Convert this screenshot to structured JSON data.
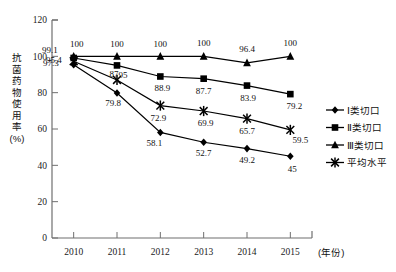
{
  "chart_data": {
    "type": "line",
    "title": "",
    "subtitle": "",
    "xlabel": "(年份)",
    "ylabel": "抗菌药物使用率（%）",
    "ylabel_chars": [
      "抗",
      "菌",
      "药",
      "物",
      "使",
      "用",
      "率",
      "(%)"
    ],
    "x": [
      "2010",
      "2011",
      "2012",
      "2013",
      "2014",
      "2015"
    ],
    "categories": [
      "2010",
      "2011",
      "2012",
      "2013",
      "2014",
      "2015"
    ],
    "ylim": [
      0,
      120
    ],
    "yticks": [
      0,
      20,
      40,
      60,
      80,
      100,
      120
    ],
    "ytick_labels": [
      "0",
      "20",
      "40",
      "60",
      "80",
      "100",
      "120"
    ],
    "grid": false,
    "legend_position": "right",
    "series": [
      {
        "name": "Ⅰ类切口",
        "marker": "diamond",
        "values": [
          95.4,
          79.8,
          58.1,
          52.7,
          49.2,
          45
        ],
        "labels": [
          "95.4",
          "79.8",
          "58.1",
          "52.7",
          "49.2",
          "45"
        ]
      },
      {
        "name": "Ⅱ类切口",
        "marker": "square",
        "values": [
          99.1,
          95,
          88.9,
          87.7,
          83.9,
          79.2
        ],
        "labels": [
          "99.1",
          "95",
          "88.9",
          "87.7",
          "83.9",
          "79.2"
        ]
      },
      {
        "name": "Ⅲ类切口",
        "marker": "triangle",
        "values": [
          100,
          100,
          100,
          100,
          96.4,
          100
        ],
        "labels": [
          "100",
          "100",
          "100",
          "100",
          "96.4",
          "100"
        ]
      },
      {
        "name": "平均水平",
        "marker": "cross",
        "values": [
          97.3,
          87,
          72.9,
          69.9,
          65.7,
          59.5
        ],
        "labels": [
          "97.3",
          "87",
          "72.9",
          "69.9",
          "65.7",
          "59.5"
        ]
      }
    ]
  },
  "legend": {
    "items": [
      {
        "label": "Ⅰ类切口",
        "marker": "diamond"
      },
      {
        "label": "Ⅱ类切口",
        "marker": "square"
      },
      {
        "label": "Ⅲ类切口",
        "marker": "triangle"
      },
      {
        "label": "平均水平",
        "marker": "cross"
      }
    ]
  },
  "colors": {
    "line": "#000000",
    "axis": "#6f6f6f",
    "text": "#111111",
    "background": "#ffffff"
  }
}
